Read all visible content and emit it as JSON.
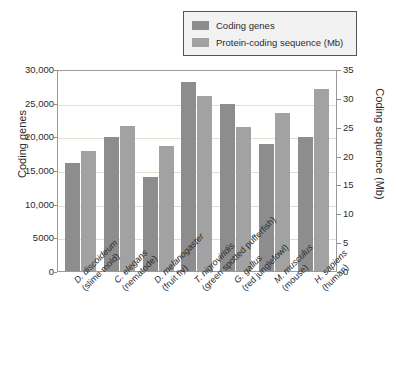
{
  "chart_data": {
    "type": "bar",
    "title": "",
    "xlabel": "",
    "ylabel": "Coding genes",
    "y2label": "Coding sequence (Mb)",
    "grid": true,
    "legend_position": "top-right",
    "ylim": [
      0,
      30000
    ],
    "y2lim": [
      0,
      35
    ],
    "yticks": [
      "0",
      "5000",
      "10,000",
      "15,000",
      "20,000",
      "25,000",
      "30,000"
    ],
    "ytick_values": [
      0,
      5000,
      10000,
      15000,
      20000,
      25000,
      30000
    ],
    "y2ticks": [
      "0",
      "5",
      "10",
      "15",
      "20",
      "25",
      "30",
      "35"
    ],
    "y2tick_values": [
      0,
      5,
      10,
      15,
      20,
      25,
      30,
      35
    ],
    "categories": [
      "D. discoideum",
      "C. elegans",
      "D. melanogaster",
      "T. nigroviridis",
      "G. gallus",
      "M. musculus",
      "H. sapiens"
    ],
    "category_common_names": [
      "(slime mold)",
      "(nematode)",
      "(fruit fly)",
      "(green spotted pufferfish)",
      "(red junglefowl)",
      "(mouse)",
      "(human)"
    ],
    "series": [
      {
        "name": "Coding genes",
        "axis": "left",
        "color": "#8d8d8d",
        "values": [
          16000,
          19900,
          13900,
          28000,
          24800,
          18900,
          19900
        ]
      },
      {
        "name": "Protein-coding sequence (Mb)",
        "axis": "right",
        "color": "#a2a2a2",
        "values": [
          20.8,
          25.2,
          21.6,
          30.3,
          24.9,
          27.3,
          31.5
        ]
      }
    ]
  },
  "legend": {
    "items": [
      {
        "label": "Coding genes",
        "color": "#8d8d8d"
      },
      {
        "label": "Protein-coding sequence (Mb)",
        "color": "#a2a2a2"
      }
    ]
  },
  "axes": {
    "left_title": "Coding genes",
    "right_title": "Coding sequence (Mb)"
  }
}
